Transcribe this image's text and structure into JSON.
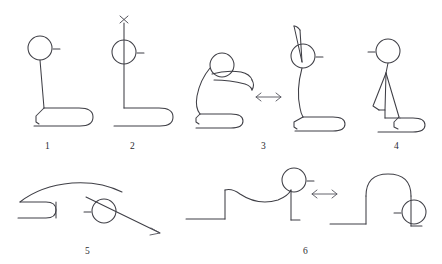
{
  "figure": {
    "type": "line-drawing-diagram",
    "background_color": "#ffffff",
    "stroke_color": "#3f3f46",
    "label_color": "#2b2b30",
    "width": 442,
    "height": 264
  },
  "panels": [
    {
      "id": "panel-1",
      "label": "1",
      "label_x": 45,
      "label_y": 142,
      "description": "upright seated figure, head circle with small right tick, straight torso, hooked leg base"
    },
    {
      "id": "panel-2",
      "label": "2",
      "label_x": 130,
      "label_y": 142,
      "description": "seated figure with vertical line through head extending up to an x mark above"
    },
    {
      "id": "panel-3",
      "label": "3",
      "label_x": 261,
      "label_y": 142,
      "description": "two poses joined by a double-headed arrow: forward-folded figure and upright figure with raised arm"
    },
    {
      "id": "panel-4",
      "label": "4",
      "label_x": 394,
      "label_y": 142,
      "description": "seated figure facing left with triangular folded arm"
    },
    {
      "id": "panel-5",
      "label": "5",
      "label_x": 85,
      "label_y": 247,
      "description": "reclining arched figure with head circle and a diagonal arrow pointing down-right"
    },
    {
      "id": "panel-6",
      "label": "6",
      "label_x": 303,
      "label_y": 247,
      "description": "two bridge poses joined by a double-headed arrow: low bridge and high arched bridge"
    }
  ],
  "arrows": [
    {
      "id": "arrow-panel-3",
      "kind": "double-headed-horizontal",
      "glyph": "left-right-arrow",
      "x": 268,
      "y": 97
    },
    {
      "id": "arrow-panel-5",
      "kind": "single-headed-diagonal",
      "glyph": "down-right-arrow",
      "x": 150,
      "y": 228
    },
    {
      "id": "arrow-panel-6",
      "kind": "double-headed-horizontal",
      "glyph": "left-right-arrow",
      "x": 324,
      "y": 194
    }
  ],
  "marks": [
    {
      "id": "x-mark-panel-2",
      "glyph": "x-mark",
      "x": 124,
      "y": 19
    }
  ]
}
